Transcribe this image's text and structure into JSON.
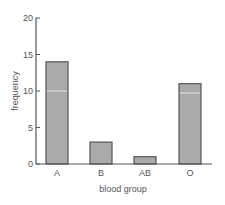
{
  "chart_data": {
    "type": "bar",
    "title": "",
    "xlabel": "blood group",
    "ylabel": "frequency",
    "categories": [
      "A",
      "B",
      "AB",
      "O"
    ],
    "values": [
      14,
      3,
      1,
      11
    ],
    "ylim": [
      0,
      20
    ],
    "yticks": [
      0,
      5,
      10,
      15,
      20
    ],
    "grid": false,
    "legend": null
  },
  "colors": {
    "bar_fill": "#aaaaaa",
    "bar_stroke": "#555555",
    "axis": "#555555",
    "text": "#555555",
    "gridline_in_bar": "#e8e8e8"
  }
}
